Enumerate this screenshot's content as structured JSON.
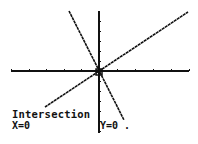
{
  "screen": {
    "type": "graphing-calculator-graph",
    "colors": {
      "background": "#ffffff",
      "ink": "#111111"
    }
  },
  "graph": {
    "x_axis": {
      "y": 71,
      "x_start": 11,
      "x_end": 189,
      "tick_count_left": 5,
      "tick_count_right": 5
    },
    "y_axis": {
      "x": 99,
      "y_start": 11,
      "y_end": 133
    },
    "lines": [
      {
        "name": "steep-line",
        "x1": 69,
        "y1": 11,
        "x2": 124,
        "y2": 120
      },
      {
        "name": "shallow-line",
        "x1": 45,
        "y1": 107,
        "x2": 188,
        "y2": 12
      }
    ],
    "cursor": {
      "x": 99,
      "y": 72
    }
  },
  "result": {
    "title": "Intersection",
    "x_label": "X=0",
    "y_label": "Y=0 ."
  }
}
